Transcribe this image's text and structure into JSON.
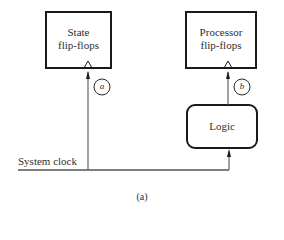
{
  "diagram": {
    "caption": "(a)",
    "blocks": {
      "state": {
        "line1": "State",
        "line2": "flip-flops"
      },
      "processor": {
        "line1": "Processor",
        "line2": "flip-flops"
      },
      "logic": {
        "label": "Logic"
      }
    },
    "signal": {
      "label": "System clock"
    },
    "markers": {
      "a": "a",
      "b": "b"
    },
    "colors": {
      "stroke": "#1a1a1a",
      "line": "#555555",
      "background": "#ffffff"
    }
  }
}
